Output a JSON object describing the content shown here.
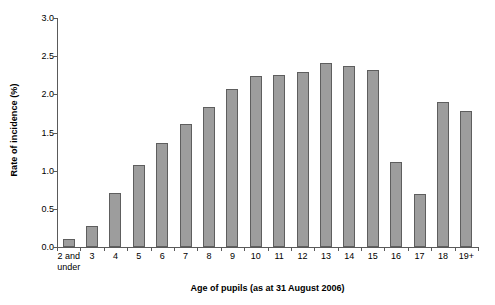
{
  "chart_data": {
    "type": "bar",
    "title": "",
    "xlabel": "Age of pupils (as at 31 August 2006)",
    "ylabel": "Rate of incidence (%)",
    "ylim": [
      0.0,
      3.0
    ],
    "ytick_labels": [
      "0.0",
      "0.5",
      "1.0",
      "1.5",
      "2.0",
      "2.5",
      "3.0"
    ],
    "ytick_values": [
      0.0,
      0.5,
      1.0,
      1.5,
      2.0,
      2.5,
      3.0
    ],
    "grid": false,
    "legend": false,
    "categories": [
      "2 and\nunder",
      "3",
      "4",
      "5",
      "6",
      "7",
      "8",
      "9",
      "10",
      "11",
      "12",
      "13",
      "14",
      "15",
      "16",
      "17",
      "18",
      "19+"
    ],
    "values": [
      0.1,
      0.27,
      0.71,
      1.08,
      1.36,
      1.61,
      1.84,
      2.07,
      2.24,
      2.26,
      2.29,
      2.41,
      2.37,
      2.32,
      1.12,
      0.7,
      1.9,
      1.78
    ],
    "bar_color": "#9d9d9d",
    "bar_border_color": "#5e5e5e",
    "axis_color": "#5a5a5a"
  }
}
